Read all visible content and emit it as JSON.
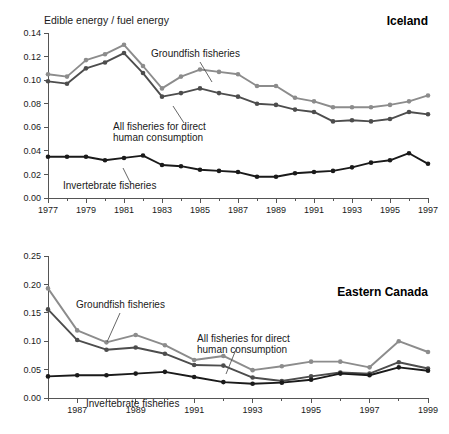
{
  "figure": {
    "axis_label": "Edible energy / fuel energy",
    "colors": {
      "groundfish": "#8c8c8c",
      "all_direct": "#4d4d4d",
      "invertebrate": "#1a1a1a",
      "axis": "#555555",
      "text": "#1a1a1a"
    }
  },
  "chart_data": [
    {
      "type": "line",
      "title": "Iceland",
      "xlabel": "",
      "ylabel": "Edible energy / fuel energy",
      "xlim": [
        1977,
        1997
      ],
      "ylim": [
        0.0,
        0.14
      ],
      "yticks": [
        "0.00",
        "0.02",
        "0.04",
        "0.06",
        "0.08",
        "0.10",
        "0.12",
        "0.14"
      ],
      "ytick_values": [
        0.0,
        0.02,
        0.04,
        0.06,
        0.08,
        0.1,
        0.12,
        0.14
      ],
      "xticks": [
        "1977",
        "1979",
        "1981",
        "1983",
        "1985",
        "1987",
        "1989",
        "1991",
        "1993",
        "1995",
        "1997"
      ],
      "xtick_values": [
        1977,
        1979,
        1981,
        1983,
        1985,
        1987,
        1989,
        1991,
        1993,
        1995,
        1997
      ],
      "grid": false,
      "legend": "annotations",
      "x": [
        1977,
        1978,
        1979,
        1980,
        1981,
        1982,
        1983,
        1984,
        1985,
        1986,
        1987,
        1988,
        1989,
        1990,
        1991,
        1992,
        1993,
        1994,
        1995,
        1996,
        1997
      ],
      "series": [
        {
          "name": "Groundfish fisheries",
          "color": "#8c8c8c",
          "values": [
            0.105,
            0.103,
            0.117,
            0.122,
            0.13,
            0.112,
            0.093,
            0.103,
            0.109,
            0.107,
            0.105,
            0.095,
            0.095,
            0.085,
            0.082,
            0.077,
            0.077,
            0.077,
            0.079,
            0.082,
            0.087
          ]
        },
        {
          "name": "All fisheries for direct human consumption",
          "color": "#4d4d4d",
          "values": [
            0.099,
            0.097,
            0.11,
            0.115,
            0.123,
            0.106,
            0.086,
            0.089,
            0.093,
            0.089,
            0.086,
            0.08,
            0.079,
            0.075,
            0.073,
            0.065,
            0.066,
            0.065,
            0.067,
            0.073,
            0.071
          ]
        },
        {
          "name": "Invertebrate fisheries",
          "color": "#1a1a1a",
          "values": [
            0.035,
            0.035,
            0.035,
            0.032,
            0.034,
            0.036,
            0.028,
            0.027,
            0.024,
            0.023,
            0.022,
            0.018,
            0.018,
            0.021,
            0.022,
            0.023,
            0.026,
            0.03,
            0.032,
            0.038,
            0.029
          ]
        }
      ],
      "annotations": [
        {
          "text": "Groundfish fisheries",
          "series": "Groundfish fisheries"
        },
        {
          "text": "All fisheries for direct",
          "text2": "human consumption",
          "series": "All fisheries for direct human consumption"
        },
        {
          "text": "Invertebrate fisheries",
          "series": "Invertebrate fisheries"
        }
      ]
    },
    {
      "type": "line",
      "title": "Eastern Canada",
      "xlabel": "",
      "ylabel": "",
      "xlim": [
        1986,
        1999
      ],
      "ylim": [
        0.0,
        0.25
      ],
      "yticks": [
        "0.00",
        "0.05",
        "0.10",
        "0.15",
        "0.20",
        "0.25"
      ],
      "ytick_values": [
        0.0,
        0.05,
        0.1,
        0.15,
        0.2,
        0.25
      ],
      "xticks": [
        "1987",
        "1989",
        "1991",
        "1993",
        "1995",
        "1997",
        "1999"
      ],
      "xtick_values": [
        1987,
        1989,
        1991,
        1993,
        1995,
        1997,
        1999
      ],
      "grid": false,
      "legend": "annotations",
      "x": [
        1986,
        1987,
        1988,
        1989,
        1990,
        1991,
        1992,
        1993,
        1994,
        1995,
        1996,
        1997,
        1998,
        1999
      ],
      "series": [
        {
          "name": "Groundfish fisheries",
          "color": "#8c8c8c",
          "values": [
            0.193,
            0.119,
            0.098,
            0.111,
            0.093,
            0.067,
            0.074,
            0.049,
            0.056,
            0.064,
            0.064,
            0.054,
            0.1,
            0.081
          ]
        },
        {
          "name": "All fisheries for direct human consumption",
          "color": "#4d4d4d",
          "values": [
            0.156,
            0.102,
            0.085,
            0.089,
            0.078,
            0.058,
            0.057,
            0.036,
            0.03,
            0.038,
            0.045,
            0.043,
            0.063,
            0.052
          ]
        },
        {
          "name": "Invertebrate fisheries",
          "color": "#1a1a1a",
          "values": [
            0.038,
            0.04,
            0.04,
            0.043,
            0.046,
            0.037,
            0.028,
            0.025,
            0.027,
            0.032,
            0.043,
            0.04,
            0.054,
            0.048
          ]
        }
      ],
      "annotations": [
        {
          "text": "Groundfish fisheries",
          "series": "Groundfish fisheries"
        },
        {
          "text": "All fisheries for direct",
          "text2": "human consumption",
          "series": "All fisheries for direct human consumption"
        },
        {
          "text": "Invertebrate fisheries",
          "series": "Invertebrate fisheries"
        }
      ]
    }
  ]
}
